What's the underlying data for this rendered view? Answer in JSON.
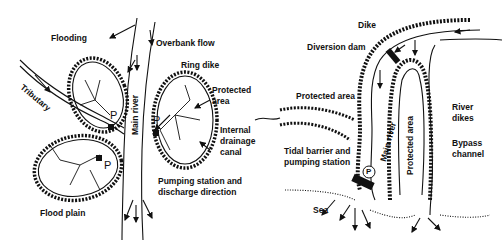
{
  "left_diagram": {
    "title": "Ring dike system",
    "labels": {
      "flooding": "Flooding",
      "overbank_flow": "Overbank flow",
      "ring_dike": "Ring dike",
      "protected_area_1": "Protected",
      "protected_area_2": "area",
      "tributary": "Tributary",
      "main_river": "Main river",
      "internal_1": "Internal",
      "internal_2": "drainage",
      "internal_3": "canal",
      "pumping_1": "Pumping station and",
      "pumping_2": "discharge direction",
      "flood_plain": "Flood plain",
      "p_marker": "P"
    }
  },
  "right_diagram": {
    "title": "Diversion / bypass system",
    "labels": {
      "dike": "Dike",
      "diversion_dam": "Diversion dam",
      "protected_area": "Protected area",
      "river_dikes_1": "River",
      "river_dikes_2": "dikes",
      "bypass_1": "Bypass",
      "bypass_2": "channel",
      "tidal_1": "Tidal barrier and",
      "tidal_2": "pumping station",
      "main_river": "Main river",
      "protected_area_vertical": "Protected area",
      "sea": "Sea",
      "p_marker": "P"
    }
  }
}
